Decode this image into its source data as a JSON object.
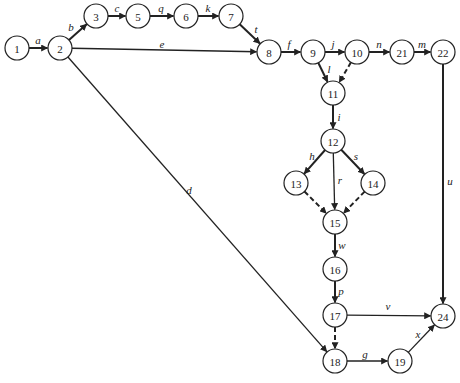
{
  "diagram": {
    "type": "activity-network",
    "node_radius": 12,
    "colors": {
      "stroke": "#222222",
      "background": "#ffffff"
    },
    "nodes": [
      {
        "id": "1",
        "x": 17,
        "y": 48
      },
      {
        "id": "2",
        "x": 60,
        "y": 48
      },
      {
        "id": "3",
        "x": 96,
        "y": 16
      },
      {
        "id": "5",
        "x": 138,
        "y": 16
      },
      {
        "id": "6",
        "x": 186,
        "y": 16
      },
      {
        "id": "7",
        "x": 231,
        "y": 16
      },
      {
        "id": "8",
        "x": 269,
        "y": 52
      },
      {
        "id": "9",
        "x": 313,
        "y": 52
      },
      {
        "id": "10",
        "x": 357,
        "y": 52
      },
      {
        "id": "21",
        "x": 402,
        "y": 52
      },
      {
        "id": "22",
        "x": 443,
        "y": 52
      },
      {
        "id": "11",
        "x": 333,
        "y": 93
      },
      {
        "id": "12",
        "x": 333,
        "y": 141
      },
      {
        "id": "13",
        "x": 296,
        "y": 183
      },
      {
        "id": "14",
        "x": 373,
        "y": 183
      },
      {
        "id": "15",
        "x": 335,
        "y": 222
      },
      {
        "id": "16",
        "x": 335,
        "y": 269
      },
      {
        "id": "17",
        "x": 335,
        "y": 315
      },
      {
        "id": "18",
        "x": 335,
        "y": 361
      },
      {
        "id": "19",
        "x": 400,
        "y": 361
      },
      {
        "id": "24",
        "x": 443,
        "y": 316
      }
    ],
    "edges": [
      {
        "from": "1",
        "to": "2",
        "label": "a",
        "style": "bold",
        "lx": 38,
        "ly": 40
      },
      {
        "from": "2",
        "to": "3",
        "label": "b",
        "style": "bold",
        "lx": 71,
        "ly": 27
      },
      {
        "from": "3",
        "to": "5",
        "label": "c",
        "style": "bold",
        "lx": 117,
        "ly": 8
      },
      {
        "from": "5",
        "to": "6",
        "label": "q",
        "style": "bold",
        "lx": 161,
        "ly": 8
      },
      {
        "from": "6",
        "to": "7",
        "label": "k",
        "style": "bold",
        "lx": 208,
        "ly": 8
      },
      {
        "from": "7",
        "to": "8",
        "label": "t",
        "style": "bold",
        "lx": 256,
        "ly": 29
      },
      {
        "from": "2",
        "to": "8",
        "label": "e",
        "style": "normal",
        "lx": 162,
        "ly": 44
      },
      {
        "from": "8",
        "to": "9",
        "label": "f",
        "style": "bold",
        "lx": 289,
        "ly": 44
      },
      {
        "from": "9",
        "to": "10",
        "label": "j",
        "style": "bold",
        "lx": 333,
        "ly": 44
      },
      {
        "from": "9",
        "to": "11",
        "label": "l",
        "style": "bold",
        "lx": 329,
        "ly": 69
      },
      {
        "from": "10",
        "to": "11",
        "label": "",
        "style": "dashed",
        "lx": 0,
        "ly": 0
      },
      {
        "from": "10",
        "to": "21",
        "label": "n",
        "style": "bold",
        "lx": 379,
        "ly": 44
      },
      {
        "from": "21",
        "to": "22",
        "label": "m",
        "style": "bold",
        "lx": 422,
        "ly": 44
      },
      {
        "from": "22",
        "to": "24",
        "label": "u",
        "style": "bold",
        "lx": 450,
        "ly": 181
      },
      {
        "from": "2",
        "to": "18",
        "label": "d",
        "style": "normal",
        "lx": 189,
        "ly": 190
      },
      {
        "from": "11",
        "to": "12",
        "label": "i",
        "style": "bold",
        "lx": 339,
        "ly": 117
      },
      {
        "from": "12",
        "to": "13",
        "label": "h",
        "style": "bold",
        "lx": 312,
        "ly": 156
      },
      {
        "from": "12",
        "to": "14",
        "label": "s",
        "style": "bold",
        "lx": 356,
        "ly": 156
      },
      {
        "from": "12",
        "to": "15",
        "label": "r",
        "style": "normal",
        "lx": 340,
        "ly": 180
      },
      {
        "from": "13",
        "to": "15",
        "label": "",
        "style": "dashed",
        "lx": 0,
        "ly": 0
      },
      {
        "from": "14",
        "to": "15",
        "label": "",
        "style": "dashed",
        "lx": 0,
        "ly": 0
      },
      {
        "from": "15",
        "to": "16",
        "label": "w",
        "style": "bold",
        "lx": 342,
        "ly": 245
      },
      {
        "from": "16",
        "to": "17",
        "label": "p",
        "style": "bold",
        "lx": 341,
        "ly": 291
      },
      {
        "from": "17",
        "to": "24",
        "label": "v",
        "style": "normal",
        "lx": 388,
        "ly": 306
      },
      {
        "from": "17",
        "to": "18",
        "label": "",
        "style": "dashed",
        "lx": 0,
        "ly": 0
      },
      {
        "from": "18",
        "to": "19",
        "label": "g",
        "style": "normal",
        "lx": 365,
        "ly": 354
      },
      {
        "from": "19",
        "to": "24",
        "label": "x",
        "style": "normal",
        "lx": 418,
        "ly": 334
      }
    ]
  }
}
